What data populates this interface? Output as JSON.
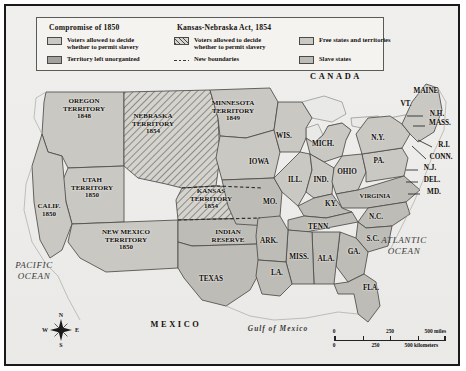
{
  "map": {
    "title": "Compromise of 1850 and Kansas-Nebraska Act, 1854",
    "colors": {
      "free_states": "#c9c8c3",
      "slave_states": "#bdbcb6",
      "unorganized_territory": "#a3a29c",
      "popular_sovereignty_1850": "#c9c8c3",
      "popular_sovereignty_1854_hatch": "#4c4b48",
      "water": "#e8e8e6",
      "border": "#1a1a1a",
      "background": "#f2f1ee"
    }
  },
  "legend": {
    "groups": [
      {
        "title": "Compromise of 1850",
        "items": [
          {
            "swatch": "solid-light",
            "label_line1": "Voters allowed to decide",
            "label_line2": "whether to permit slavery"
          },
          {
            "swatch": "solid-dark",
            "label_line1": "Territory left unorganized",
            "label_line2": ""
          }
        ]
      },
      {
        "title": "Kansas-Nebraska Act, 1854",
        "items": [
          {
            "swatch": "hatched",
            "label_line1": "Voters allowed to decide",
            "label_line2": "whether to permit slavery"
          },
          {
            "swatch": "dashed-line",
            "label_line1": "New boundaries",
            "label_line2": ""
          }
        ]
      },
      {
        "title": "",
        "items": [
          {
            "swatch": "solid-free",
            "label_line1": "Free states and territories",
            "label_line2": ""
          },
          {
            "swatch": "solid-slave",
            "label_line1": "Slave states",
            "label_line2": ""
          }
        ]
      }
    ]
  },
  "territories": [
    {
      "name": "OREGON TERRITORY",
      "year": "1848",
      "x": 78,
      "y": 103
    },
    {
      "name": "UTAH TERRITORY",
      "year": "1850",
      "x": 86,
      "y": 182
    },
    {
      "name": "NEW MEXICO TERRITORY",
      "year": "1850",
      "x": 120,
      "y": 234
    },
    {
      "name": "NEBRASKA TERRITORY",
      "year": "1854",
      "x": 147,
      "y": 118
    },
    {
      "name": "KANSAS TERRITORY",
      "year": "1854",
      "x": 205,
      "y": 193
    },
    {
      "name": "MINNESOTA TERRITORY",
      "year": "1849",
      "x": 227,
      "y": 105
    },
    {
      "name": "INDIAN RESERVE",
      "year": "",
      "x": 222,
      "y": 231
    },
    {
      "name": "CALIF.",
      "year": "1850",
      "x": 43,
      "y": 205
    }
  ],
  "states": [
    {
      "label": "WIS.",
      "x": 278,
      "y": 131
    },
    {
      "label": "MICH.",
      "x": 317,
      "y": 139
    },
    {
      "label": "IOWA",
      "x": 253,
      "y": 157
    },
    {
      "label": "ILL.",
      "x": 289,
      "y": 175
    },
    {
      "label": "IND.",
      "x": 315,
      "y": 175
    },
    {
      "label": "OHIO",
      "x": 341,
      "y": 167
    },
    {
      "label": "PA.",
      "x": 373,
      "y": 156
    },
    {
      "label": "N.Y.",
      "x": 372,
      "y": 133
    },
    {
      "label": "MAINE",
      "x": 420,
      "y": 86
    },
    {
      "label": "VT.",
      "x": 400,
      "y": 99
    },
    {
      "label": "N.H.",
      "x": 431,
      "y": 109
    },
    {
      "label": "MASS.",
      "x": 434,
      "y": 118
    },
    {
      "label": "R.I.",
      "x": 438,
      "y": 140
    },
    {
      "label": "CONN.",
      "x": 435,
      "y": 152
    },
    {
      "label": "N.J.",
      "x": 424,
      "y": 163
    },
    {
      "label": "DEL.",
      "x": 426,
      "y": 175
    },
    {
      "label": "MD.",
      "x": 428,
      "y": 187
    },
    {
      "label": "VIRGINIA",
      "x": 369,
      "y": 190
    },
    {
      "label": "MO.",
      "x": 264,
      "y": 197
    },
    {
      "label": "KY.",
      "x": 325,
      "y": 199
    },
    {
      "label": "TENN.",
      "x": 313,
      "y": 222
    },
    {
      "label": "N.C.",
      "x": 370,
      "y": 212
    },
    {
      "label": "S.C.",
      "x": 367,
      "y": 234
    },
    {
      "label": "ARK.",
      "x": 263,
      "y": 236
    },
    {
      "label": "MISS.",
      "x": 293,
      "y": 252
    },
    {
      "label": "ALA.",
      "x": 320,
      "y": 254
    },
    {
      "label": "GA.",
      "x": 348,
      "y": 247
    },
    {
      "label": "LA.",
      "x": 271,
      "y": 268
    },
    {
      "label": "FLA.",
      "x": 365,
      "y": 283
    },
    {
      "label": "TEXAS",
      "x": 205,
      "y": 274
    }
  ],
  "water_labels": [
    {
      "line1": "PACIFIC",
      "line2": "OCEAN",
      "x": 28,
      "y": 265
    },
    {
      "line1": "ATLANTIC",
      "line2": "OCEAN",
      "x": 398,
      "y": 240
    }
  ],
  "gulf_label": {
    "text": "Gulf of Mexico",
    "x": 272,
    "y": 322
  },
  "countries": [
    {
      "name": "CANADA",
      "x": 330,
      "y": 70
    },
    {
      "name": "MEXICO",
      "x": 170,
      "y": 318
    }
  ],
  "compass": {
    "north": "N",
    "south": "S",
    "east": "E",
    "west": "W"
  },
  "scale": {
    "miles": {
      "ticks": [
        "0",
        "250",
        "500 miles"
      ]
    },
    "kilometers": {
      "ticks": [
        "0",
        "250",
        "500 kilometers"
      ]
    }
  }
}
